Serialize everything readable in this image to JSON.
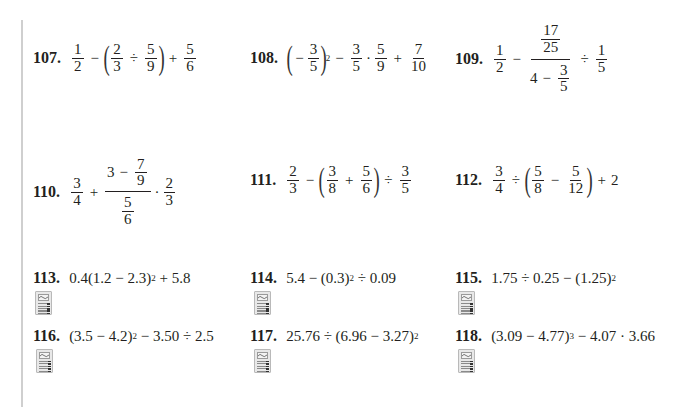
{
  "page": {
    "type": "math-exercise-set",
    "margin_rule_color": "#cfcfcf",
    "text_color": "#231f20"
  },
  "problems": [
    {
      "number": "107.",
      "expression": "1/2 − (2/3 ÷ 5/9) + 5/6",
      "parts": {
        "a_n": "1",
        "a_d": "2",
        "op1": "−",
        "b_n": "2",
        "b_d": "3",
        "op2": "÷",
        "c_n": "5",
        "c_d": "9",
        "op3": "+",
        "d_n": "5",
        "d_d": "6"
      }
    },
    {
      "number": "108.",
      "expression": "(−3/5)^2 − 3/5 · 5/9 + 7/10",
      "parts": {
        "neg": "−",
        "a_n": "3",
        "a_d": "5",
        "exp": "2",
        "op1": "−",
        "b_n": "3",
        "b_d": "5",
        "op2": "·",
        "c_n": "5",
        "c_d": "9",
        "op3": "+",
        "d_n": "7",
        "d_d": "10"
      }
    },
    {
      "number": "109.",
      "expression": "1/2 − (17/25)/(4 − 3/5) ÷ 1/5",
      "parts": {
        "a_n": "1",
        "a_d": "2",
        "op1": "−",
        "top_n": "17",
        "top_d": "25",
        "bot_whole": "4",
        "bot_op": "−",
        "bot_n": "3",
        "bot_d": "5",
        "op2": "÷",
        "c_n": "1",
        "c_d": "5"
      }
    },
    {
      "number": "110.",
      "expression": "3/4 + (3 − 7/9)/(5/6) · 2/3",
      "parts": {
        "a_n": "3",
        "a_d": "4",
        "op1": "+",
        "top_whole": "3",
        "top_op": "−",
        "top_n": "7",
        "top_d": "9",
        "bot_n": "5",
        "bot_d": "6",
        "op2": "·",
        "c_n": "2",
        "c_d": "3"
      }
    },
    {
      "number": "111.",
      "expression": "2/3 − (3/8 + 5/6) ÷ 3/5",
      "parts": {
        "a_n": "2",
        "a_d": "3",
        "op1": "−",
        "b_n": "3",
        "b_d": "8",
        "op2": "+",
        "c_n": "5",
        "c_d": "6",
        "op3": "÷",
        "d_n": "3",
        "d_d": "5"
      }
    },
    {
      "number": "112.",
      "expression": "3/4 ÷ (5/8 − 5/12) + 2",
      "parts": {
        "a_n": "3",
        "a_d": "4",
        "op1": "÷",
        "b_n": "5",
        "b_d": "8",
        "op2": "−",
        "c_n": "5",
        "c_d": "12",
        "op3": "+",
        "tail": "2"
      }
    },
    {
      "number": "113.",
      "expression": "0.4(1.2 − 2.3)^2 + 5.8",
      "pre": "0.4(1.2 − 2.3)",
      "exp": "2",
      "post": " + 5.8",
      "calculator_icon": true
    },
    {
      "number": "114.",
      "expression": "5.4 − (0.3)^2 ÷ 0.09",
      "pre": "5.4 − (0.3)",
      "exp": "2",
      "post": " ÷ 0.09",
      "calculator_icon": true
    },
    {
      "number": "115.",
      "expression": "1.75 ÷ 0.25 − (1.25)^2",
      "pre": "1.75 ÷ 0.25 − (1.25)",
      "exp": "2",
      "post": "",
      "calculator_icon": true
    },
    {
      "number": "116.",
      "expression": "(3.5 − 4.2)^2 − 3.50 ÷ 2.5",
      "pre": "(3.5 − 4.2)",
      "exp": "2",
      "post": " − 3.50 ÷ 2.5",
      "calculator_icon": true
    },
    {
      "number": "117.",
      "expression": "25.76 ÷ (6.96 − 3.27)^2",
      "pre": "25.76 ÷ (6.96 − 3.27)",
      "exp": "2",
      "post": "",
      "calculator_icon": true
    },
    {
      "number": "118.",
      "expression": "(3.09 − 4.77)^3 − 4.07 · 3.66",
      "pre": "(3.09 − 4.77)",
      "exp": "3",
      "post": " − 4.07 · 3.66",
      "calculator_icon": true
    }
  ],
  "icons": {
    "calculator": "graphing-calculator-icon"
  }
}
